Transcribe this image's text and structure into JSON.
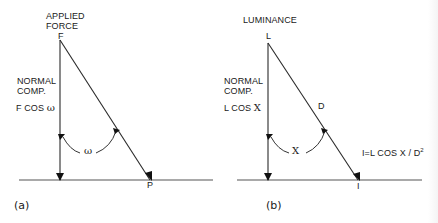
{
  "colors": {
    "background": "#ffffff",
    "line": "#2a2a2a",
    "text": "#1a1a1a"
  },
  "diagram_a": {
    "panel_label": "(a)",
    "top_label_line1": "APPLIED",
    "top_label_line2": "FORCE",
    "apex_label": "F",
    "side_label_line1": "NORMAL",
    "side_label_line2": "COMP.",
    "component_label_prefix": "F COS",
    "component_symbol": "ω",
    "angle_label": "ω",
    "point_label": "P",
    "geometry": {
      "vertical_x": 60,
      "apex_y": 40,
      "base_y": 180,
      "hyp_end_x": 150,
      "baseline_x1": 19,
      "baseline_x2": 213
    }
  },
  "diagram_b": {
    "panel_label": "(b)",
    "top_label": "LUMINANCE",
    "apex_label": "L",
    "side_label_line1": "NORMAL",
    "side_label_line2": "COMP.",
    "component_label_prefix": "L COS",
    "component_symbol": "X",
    "angle_label": "X",
    "distance_label": "D",
    "point_label": "I",
    "formula": "I=L COS X / D",
    "formula_exponent": "2",
    "geometry": {
      "vertical_x": 268,
      "apex_y": 43,
      "base_y": 180,
      "hyp_end_x": 358,
      "baseline_x1": 237,
      "baseline_x2": 422
    }
  }
}
